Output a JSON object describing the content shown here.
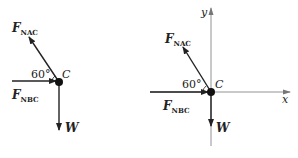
{
  "diagrams": [
    {
      "name": "free-body-diagram",
      "point": "C",
      "angle": "60°",
      "forces": {
        "nac": {
          "symbol": "F",
          "sub": "NAC"
        },
        "nbc": {
          "symbol": "F",
          "sub": "NBC"
        },
        "w": "W"
      }
    },
    {
      "name": "free-body-diagram-with-axes",
      "point": "C",
      "angle": "60°",
      "forces": {
        "nac": {
          "symbol": "F",
          "sub": "NAC"
        },
        "nbc": {
          "symbol": "F",
          "sub": "NBC"
        },
        "w": "W"
      },
      "axes": {
        "x": "x",
        "y": "y"
      }
    }
  ],
  "colors": {
    "line": "#222222",
    "axis": "#777777"
  }
}
